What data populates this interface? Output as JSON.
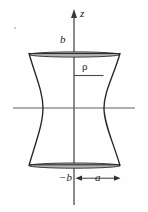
{
  "figure": {
    "kind": "hyperboloid-of-one-sheet-cross-section",
    "background_color": "#fefefe",
    "ink_color": "#2a2a2a",
    "axis_color": "#555555",
    "band_fill_color": "#b0b0b0",
    "labels": {
      "z_axis": "z",
      "top_height": "b",
      "bottom_height": "−b",
      "radius": "ρ",
      "waist_radius": "a"
    },
    "geometry": {
      "z_axis_x": 74,
      "z_axis_top_y": 10,
      "z_axis_bottom_y": 205,
      "rho_axis_y": 108,
      "rho_axis_left_x": 13,
      "rho_axis_right_x": 135,
      "top_band_y": 53,
      "bottom_band_y": 166,
      "outer_left_x": 29,
      "outer_right_x": 120,
      "waist_left_x": 43,
      "waist_right_x": 104,
      "rho_segment_y": 75,
      "rho_segment_x_start": 74,
      "rho_segment_x_end": 103,
      "dimension_arrow_y": 178,
      "dimension_arrow_x_start": 76,
      "dimension_arrow_x_end": 120
    }
  }
}
